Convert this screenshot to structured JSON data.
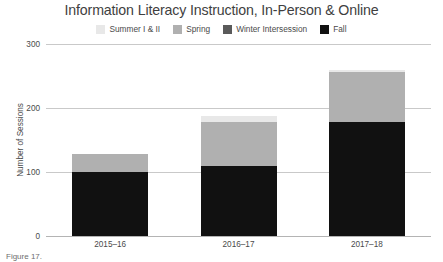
{
  "chart_data": {
    "type": "bar",
    "title": "Information Literacy Instruction, In-Person & Online",
    "xlabel": "",
    "ylabel": "Number of Sessions",
    "categories": [
      "2015–16",
      "2016–17",
      "2017–18"
    ],
    "ylim": [
      0,
      300
    ],
    "yticks": [
      0,
      100,
      200,
      300
    ],
    "ytick_labels": [
      "0",
      "100",
      "200",
      "300"
    ],
    "grid": true,
    "stacked": true,
    "legend_position": "top-center",
    "series": [
      {
        "name": "Summer I & II",
        "color": "#e8e8e8",
        "values": [
          0,
          10,
          4
        ]
      },
      {
        "name": "Spring",
        "color": "#b0b0b0",
        "values": [
          28,
          68,
          78
        ]
      },
      {
        "name": "Winter Intersession",
        "color": "#5a5a5a",
        "values": [
          0,
          0,
          0
        ]
      },
      {
        "name": "Fall",
        "color": "#111111",
        "values": [
          100,
          110,
          178
        ]
      }
    ],
    "totals": [
      128,
      188,
      260
    ],
    "stack_order_bottom_to_top": [
      "Fall",
      "Winter Intersession",
      "Spring",
      "Summer I & II"
    ]
  },
  "caption": {
    "text": "Figure 17."
  }
}
